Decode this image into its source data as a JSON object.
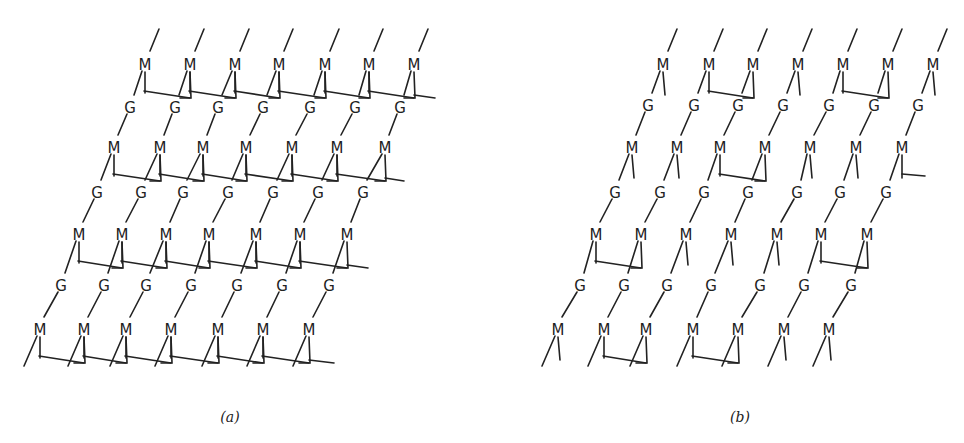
{
  "figure": {
    "panels": [
      {
        "id": "a",
        "caption": "(a)",
        "caption_pos": [
          230,
          422
        ],
        "rows": [
          {
            "type": "M",
            "y": 65,
            "x": [
              145,
              190,
              235,
              279,
              325,
              369,
              414
            ]
          },
          {
            "type": "G",
            "y": 108,
            "x": [
              130,
              175,
              218,
              263,
              310,
              355,
              400
            ]
          },
          {
            "type": "M",
            "y": 148,
            "x": [
              114,
              160,
              203,
              246,
              292,
              337,
              385
            ]
          },
          {
            "type": "G",
            "y": 193,
            "x": [
              97,
              141,
              183,
              228,
              273,
              318,
              363
            ]
          },
          {
            "type": "M",
            "y": 235,
            "x": [
              79,
              122,
              166,
              209,
              256,
              300,
              347
            ]
          },
          {
            "type": "G",
            "y": 286,
            "x": [
              61,
              104,
              146,
              191,
              237,
              282,
              329
            ]
          },
          {
            "type": "M",
            "y": 330,
            "x": [
              40,
              84,
              126,
              171,
              218,
              263,
              309
            ]
          }
        ],
        "crosslinks": [
          {
            "row": 0,
            "pairs": [
              [
                0,
                1
              ],
              [
                1,
                2
              ],
              [
                2,
                3
              ],
              [
                3,
                4
              ],
              [
                4,
                5
              ],
              [
                5,
                6
              ]
            ],
            "tail_right": true,
            "tail_to": 435
          },
          {
            "row": 2,
            "pairs": [
              [
                0,
                1
              ],
              [
                1,
                2
              ],
              [
                2,
                3
              ],
              [
                3,
                4
              ],
              [
                4,
                5
              ],
              [
                5,
                6
              ]
            ],
            "tail_right": true,
            "tail_to": 404
          },
          {
            "row": 4,
            "pairs": [
              [
                0,
                1
              ],
              [
                1,
                2
              ],
              [
                2,
                3
              ],
              [
                3,
                4
              ],
              [
                4,
                5
              ],
              [
                5,
                6
              ]
            ],
            "tail_right": true,
            "tail_to": 368
          },
          {
            "row": 6,
            "pairs": [
              [
                0,
                1
              ],
              [
                1,
                2
              ],
              [
                2,
                3
              ],
              [
                3,
                4
              ],
              [
                4,
                5
              ],
              [
                5,
                6
              ]
            ],
            "tail_right": true,
            "tail_to": 334
          }
        ]
      },
      {
        "id": "b",
        "caption": "(b)",
        "caption_pos": [
          740,
          422
        ],
        "rows": [
          {
            "type": "M",
            "y": 65,
            "x": [
              663,
              709,
              753,
              798,
              843,
              888,
              933
            ]
          },
          {
            "type": "G",
            "y": 106,
            "x": [
              648,
              694,
              738,
              783,
              829,
              874,
              918
            ]
          },
          {
            "type": "M",
            "y": 148,
            "x": [
              632,
              677,
              720,
              765,
              810,
              856,
              902
            ]
          },
          {
            "type": "G",
            "y": 193,
            "x": [
              615,
              660,
              704,
              748,
              797,
              840,
              886
            ]
          },
          {
            "type": "M",
            "y": 235,
            "x": [
              596,
              641,
              686,
              731,
              777,
              821,
              867
            ]
          },
          {
            "type": "G",
            "y": 286,
            "x": [
              580,
              624,
              667,
              711,
              760,
              804,
              851
            ]
          },
          {
            "type": "M",
            "y": 330,
            "x": [
              558,
              604,
              646,
              693,
              738,
              784,
              829
            ]
          }
        ],
        "crosslinks": [
          {
            "row": 0,
            "pairs": [
              [
                1,
                2
              ],
              [
                4,
                5
              ]
            ],
            "tail_right": false
          },
          {
            "row": 2,
            "pairs": [
              [
                2,
                3
              ]
            ],
            "tail_right": false,
            "half_link_col": 6,
            "half_link_to": 925
          },
          {
            "row": 4,
            "pairs": [
              [
                0,
                1
              ],
              [
                5,
                6
              ]
            ],
            "tail_right": false
          },
          {
            "row": 6,
            "pairs": [
              [
                1,
                2
              ],
              [
                3,
                4
              ]
            ],
            "tail_right": false
          }
        ]
      }
    ],
    "legend": {
      "M": "M",
      "G": "G"
    },
    "style": {
      "stroke": "#222222",
      "background": "#ffffff"
    }
  }
}
